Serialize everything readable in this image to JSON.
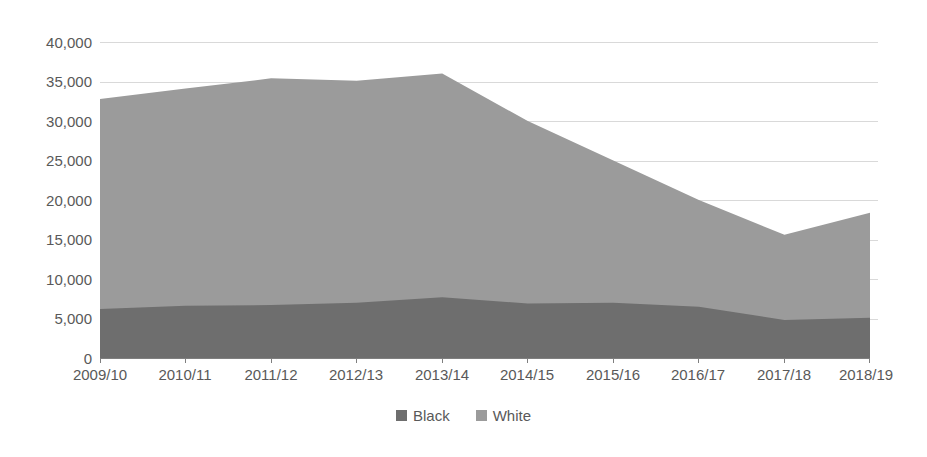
{
  "chart_data": {
    "type": "area",
    "stacked": true,
    "title": "",
    "subtitle": "",
    "xlabel": "",
    "ylabel": "",
    "categories": [
      "2009/10",
      "2010/11",
      "2011/12",
      "2012/13",
      "2013/14",
      "2014/15",
      "2015/16",
      "2016/17",
      "2017/18",
      "2018/19"
    ],
    "series": [
      {
        "name": "Black",
        "color": "#6e6e6e",
        "values": [
          6200,
          6600,
          6700,
          7000,
          7700,
          6900,
          7000,
          6500,
          4800,
          5100
        ]
      },
      {
        "name": "White",
        "color": "#9b9b9b",
        "values": [
          26600,
          27500,
          28700,
          28100,
          28300,
          23100,
          18000,
          13500,
          10800,
          13300
        ]
      }
    ],
    "stack_totals": [
      32800,
      34100,
      35400,
      35100,
      36000,
      30000,
      25000,
      20000,
      15600,
      18400
    ],
    "ylim": [
      0,
      40000
    ],
    "yticks": [
      0,
      5000,
      10000,
      15000,
      20000,
      25000,
      30000,
      35000,
      40000
    ],
    "ytick_labels": [
      "0",
      "5,000",
      "10,000",
      "15,000",
      "20,000",
      "25,000",
      "30,000",
      "35,000",
      "40,000"
    ],
    "grid": true,
    "grid_color": "#d9d9d9",
    "legend_position": "bottom",
    "legend": [
      {
        "label": "Black",
        "color": "#6e6e6e"
      },
      {
        "label": "White",
        "color": "#9b9b9b"
      }
    ]
  },
  "axes": {
    "y_tick_labels": [
      "40,000",
      "35,000",
      "30,000",
      "25,000",
      "20,000",
      "15,000",
      "10,000",
      "5,000",
      "0"
    ],
    "x_tick_labels": [
      "2009/10",
      "2010/11",
      "2011/12",
      "2012/13",
      "2013/14",
      "2014/15",
      "2015/16",
      "2016/17",
      "2017/18",
      "2018/19"
    ]
  },
  "legend": {
    "items": [
      {
        "label": "Black",
        "color": "#6e6e6e"
      },
      {
        "label": "White",
        "color": "#9b9b9b"
      }
    ]
  }
}
